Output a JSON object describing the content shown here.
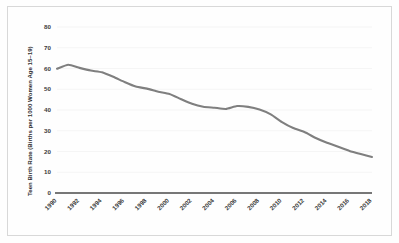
{
  "chart_data": {
    "type": "line",
    "title": "",
    "xlabel": "",
    "ylabel": "Teen Birth Rate (Births per 1000 Women Age 15–19)",
    "ylim": [
      0,
      80
    ],
    "xlim": [
      1990,
      2018
    ],
    "grid": true,
    "legend": false,
    "legend_position": "none",
    "line_color": "#7f7f7f",
    "y_ticks": [
      0,
      10,
      20,
      30,
      40,
      50,
      60,
      70,
      80
    ],
    "y_tick_labels": [
      "0",
      "10",
      "20",
      "30",
      "40",
      "50",
      "60",
      "70",
      "80"
    ],
    "x_ticks": [
      1990,
      1992,
      1994,
      1996,
      1998,
      2000,
      2002,
      2004,
      2006,
      2008,
      2010,
      2012,
      2014,
      2016,
      2018
    ],
    "x_tick_labels": [
      "1990",
      "1992",
      "1994",
      "1996",
      "1998",
      "2000",
      "2002",
      "2004",
      "2006",
      "2008",
      "2010",
      "2012",
      "2014",
      "2016",
      "2018"
    ],
    "x": [
      1990,
      1991,
      1992,
      1993,
      1994,
      1995,
      1996,
      1997,
      1998,
      1999,
      2000,
      2001,
      2002,
      2003,
      2004,
      2005,
      2006,
      2007,
      2008,
      2009,
      2010,
      2011,
      2012,
      2013,
      2014,
      2015,
      2016,
      2017,
      2018
    ],
    "series": [
      {
        "name": "Teen Birth Rate",
        "values": [
          59.9,
          61.8,
          60.3,
          59.0,
          58.2,
          56.0,
          53.5,
          51.3,
          50.3,
          48.8,
          47.7,
          45.3,
          43.0,
          41.6,
          41.1,
          40.5,
          41.9,
          41.5,
          40.2,
          37.9,
          34.2,
          31.3,
          29.4,
          26.5,
          24.2,
          22.3,
          20.3,
          18.8,
          17.4
        ]
      }
    ]
  },
  "axes": {
    "y_axis_title": "Teen Birth Rate (Births per 1000 Women Age 15–19)"
  }
}
